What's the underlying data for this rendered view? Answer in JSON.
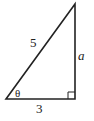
{
  "diagram": {
    "type": "right-triangle",
    "stroke_color": "#222222",
    "background": "#ffffff",
    "vertices": {
      "angle_vertex": [
        6,
        99
      ],
      "right_angle_vertex": [
        75,
        99
      ],
      "top_vertex": [
        75,
        4
      ]
    },
    "labels": {
      "hypotenuse": "5",
      "opposite": "a",
      "adjacent": "3",
      "angle": "θ"
    },
    "right_angle_marker": true
  }
}
